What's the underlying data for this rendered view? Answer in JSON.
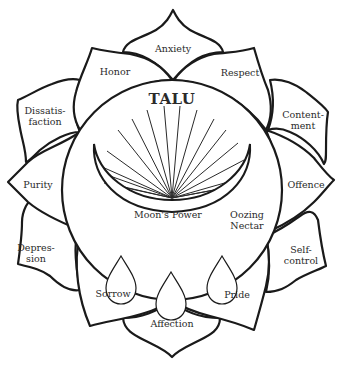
{
  "diagram": {
    "title": "TALU",
    "center_labels": {
      "moon": "Moon's Power",
      "nectar": "Oozing\nNectar"
    },
    "petals": [
      {
        "id": "anxiety",
        "label": "Anxiety"
      },
      {
        "id": "respect",
        "label": "Respect"
      },
      {
        "id": "contentment",
        "label": "Content-\nment"
      },
      {
        "id": "offence",
        "label": "Offence"
      },
      {
        "id": "self-control",
        "label": "Self-\ncontrol"
      },
      {
        "id": "pride",
        "label": "Pride"
      },
      {
        "id": "affection",
        "label": "Affection"
      },
      {
        "id": "sorrow",
        "label": "Sorrow"
      },
      {
        "id": "depression",
        "label": "Depres-\nsion"
      },
      {
        "id": "purity",
        "label": "Purity"
      },
      {
        "id": "dissatisfaction",
        "label": "Dissatis-\nfaction"
      },
      {
        "id": "honor",
        "label": "Honor"
      }
    ],
    "drops_count": 3,
    "rays_count": 18,
    "colors": {
      "stroke": "#1a1a1a",
      "background": "#ffffff",
      "text": "#2a2a2a"
    }
  }
}
